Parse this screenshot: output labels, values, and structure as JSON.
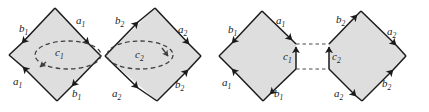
{
  "figure": {
    "background_color": "#ffffff",
    "face_fill_color": "#dedede",
    "edge_color": "#1a1a1a",
    "dashed_color": "#4a4a4a",
    "panels": [
      {
        "name": "left-panel",
        "description": "Two shaded diamonds meeting at a point, each containing a dashed ellipse loop",
        "diamonds": [
          {
            "name": "diamond-a1b1",
            "edge_labels": [
              {
                "base": "b",
                "sub": "1",
                "position": "upper-left"
              },
              {
                "base": "a",
                "sub": "1",
                "position": "upper-right"
              },
              {
                "base": "a",
                "sub": "1",
                "position": "lower-left"
              },
              {
                "base": "b",
                "sub": "1",
                "position": "lower-right"
              }
            ],
            "loop_label": {
              "base": "c",
              "sub": "1"
            },
            "loop_style": "dashed-ellipse"
          },
          {
            "name": "diamond-a2b2",
            "edge_labels": [
              {
                "base": "b",
                "sub": "2",
                "position": "upper-left"
              },
              {
                "base": "a",
                "sub": "2",
                "position": "upper-right"
              },
              {
                "base": "a",
                "sub": "2",
                "position": "lower-left"
              },
              {
                "base": "b",
                "sub": "2",
                "position": "lower-right"
              }
            ],
            "loop_label": {
              "base": "c",
              "sub": "2"
            },
            "loop_style": "dashed-ellipse"
          }
        ]
      },
      {
        "name": "right-panel",
        "description": "Same two diamonds pulled apart, each truncated to a vertical edge, joined by horizontal dashed identification lines",
        "diamonds": [
          {
            "name": "diamond-a1b1-cut",
            "edge_labels": [
              {
                "base": "b",
                "sub": "1",
                "position": "upper-left"
              },
              {
                "base": "a",
                "sub": "1",
                "position": "upper-right"
              },
              {
                "base": "a",
                "sub": "1",
                "position": "lower-left"
              },
              {
                "base": "b",
                "sub": "1",
                "position": "lower-right"
              }
            ],
            "cut_edge_label": {
              "base": "c",
              "sub": "1"
            },
            "cut_edge_style": "solid-vertical-up-arrow"
          },
          {
            "name": "diamond-a2b2-cut",
            "edge_labels": [
              {
                "base": "b",
                "sub": "2",
                "position": "upper-left"
              },
              {
                "base": "a",
                "sub": "2",
                "position": "upper-right"
              },
              {
                "base": "a",
                "sub": "2",
                "position": "lower-left"
              },
              {
                "base": "b",
                "sub": "2",
                "position": "lower-right"
              }
            ],
            "cut_edge_label": {
              "base": "c",
              "sub": "2"
            },
            "cut_edge_style": "solid-vertical-up-arrow"
          }
        ],
        "connectors": [
          {
            "name": "top-identification-line",
            "style": "dashed-horizontal"
          },
          {
            "name": "bottom-identification-line",
            "style": "dashed-horizontal"
          }
        ]
      }
    ]
  }
}
